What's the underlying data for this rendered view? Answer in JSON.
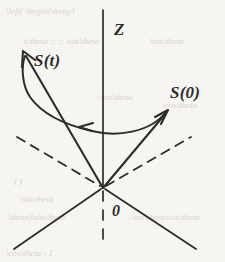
{
  "figure": {
    "width": 225,
    "height": 262,
    "background_color": "#f6f5f2",
    "ink_color": "#2e2c2a"
  },
  "labels": {
    "z_axis": "Z",
    "spin_t": "S(t)",
    "spin_0": "S(0)",
    "origin": "0"
  },
  "background_bleed": {
    "note": "faint show-through text from reverse side of page",
    "fragments": [
      {
        "text": "\\left( \\begin{array}",
        "x": 6,
        "y": 6
      },
      {
        "text": "s\\theta  \\; \\; \\sin\\theta",
        "x": 24,
        "y": 36
      },
      {
        "text": "\\sin\\theta",
        "x": 150,
        "y": 36
      },
      {
        "text": "-\\sin\\theta",
        "x": 96,
        "y": 92
      },
      {
        "text": "\\cos\\theta",
        "x": 162,
        "y": 100
      },
      {
        "text": "( )",
        "x": 14,
        "y": 176
      },
      {
        "text": "\\sin\\theta",
        "x": 20,
        "y": 194
      },
      {
        "text": "\\theta)\\sin\\theta",
        "x": 8,
        "y": 212
      },
      {
        "text": "-\\sin\\theta\\cos\\theta",
        "x": 128,
        "y": 212
      },
      {
        "text": "\\cos\\theta - 1",
        "x": 6,
        "y": 248
      }
    ]
  },
  "geometry": {
    "origin": {
      "x": 103,
      "y": 188
    },
    "z_axis": {
      "x": 103,
      "y_top": 10,
      "y_bottom": 188,
      "style": "solid"
    },
    "z_axis_below": {
      "x": 103,
      "y_top": 190,
      "y_bottom": 241,
      "style": "dashed"
    },
    "axis_left_dashed": {
      "x1": 17,
      "y1": 137,
      "x2": 101,
      "y2": 187,
      "style": "dashed"
    },
    "axis_right_dashed": {
      "x1": 105,
      "y1": 187,
      "x2": 191,
      "y2": 137,
      "style": "dashed"
    },
    "axis_left_solid": {
      "x1": 101,
      "y1": 189,
      "x2": 14,
      "y2": 249,
      "style": "solid"
    },
    "axis_right_solid": {
      "x1": 105,
      "y1": 189,
      "x2": 196,
      "y2": 249,
      "style": "solid"
    },
    "vector_spin_t": {
      "x1": 103,
      "y1": 188,
      "x2": 24,
      "y2": 53,
      "arrowhead": "at_tip"
    },
    "vector_spin_0": {
      "x1": 103,
      "y1": 188,
      "x2": 167,
      "y2": 111,
      "arrowhead": "at_tip"
    },
    "precession_arc": {
      "description": "curved path from S(0) tip sweeping left to S(t) tip, arrowhead pointing left at mid-arc",
      "start": {
        "x": 166,
        "y": 112
      },
      "end": {
        "x": 25,
        "y": 56
      },
      "arrowhead": {
        "x": 80,
        "y": 127,
        "direction": "left"
      }
    }
  }
}
